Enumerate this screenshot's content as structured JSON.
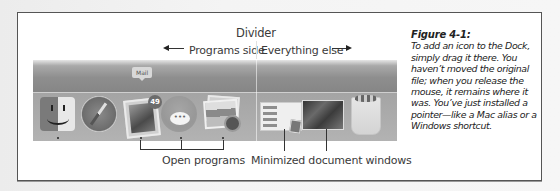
{
  "figure": {
    "labels": {
      "divider": "Divider",
      "programs_side": "Programs side",
      "everything_else": "Everything else",
      "open_programs": "Open programs",
      "minimized_windows": "Minimized document windows"
    },
    "dock": {
      "tooltip": "Mail",
      "mail_badge": "49",
      "messages_glyph": "•••",
      "icons": [
        {
          "name": "Finder",
          "icon": "finder-icon",
          "side": "programs",
          "running": true
        },
        {
          "name": "Safari",
          "icon": "safari-icon",
          "side": "programs",
          "running": false
        },
        {
          "name": "Mail",
          "icon": "mail-icon",
          "side": "programs",
          "running": true
        },
        {
          "name": "Messages",
          "icon": "messages-icon",
          "side": "programs",
          "running": true
        },
        {
          "name": "Photos",
          "icon": "photos-icon",
          "side": "programs",
          "running": true
        },
        {
          "name": "Minimized document window 1",
          "icon": "minimized-window-icon",
          "side": "everything-else"
        },
        {
          "name": "Minimized document window 2",
          "icon": "minimized-window-icon",
          "side": "everything-else"
        },
        {
          "name": "Trash",
          "icon": "trash-icon",
          "side": "everything-else"
        }
      ]
    }
  },
  "caption": {
    "title": "Figure 4-1:",
    "body": "To add an icon to the Dock, simply drag it there. You haven’t moved the original file; when you release the mouse, it remains where it was. You’ve just installed a pointer—like a Mac alias or a Windows shortcut."
  }
}
